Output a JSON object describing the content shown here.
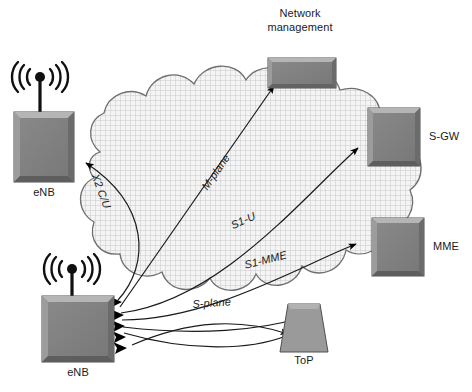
{
  "diagram": {
    "background_color": "#ffffff",
    "cloud": {
      "name": "transport-network-cloud",
      "fill_color": "#f2f2f2",
      "hatch_color": "#c9c9c9",
      "outline_color": "#6e6e6e"
    },
    "nodes": [
      {
        "id": "enb-top",
        "label": "eNB",
        "type": "enb-box",
        "has_antenna": true,
        "fill_color": "#808080"
      },
      {
        "id": "enb-bottom",
        "label": "eNB",
        "type": "enb-box",
        "has_antenna": true,
        "fill_color": "#808080"
      },
      {
        "id": "network-management",
        "label": "Network\nmanagement",
        "label_line1": "Network",
        "label_line2": "management",
        "type": "wide-box",
        "has_antenna": false,
        "fill_color": "#808080"
      },
      {
        "id": "s-gw",
        "label": "S-GW",
        "type": "box",
        "has_antenna": false,
        "fill_color": "#808080"
      },
      {
        "id": "mme",
        "label": "MME",
        "type": "box",
        "has_antenna": false,
        "fill_color": "#808080"
      },
      {
        "id": "top",
        "label": "ToP",
        "type": "trapezoid",
        "has_antenna": false,
        "fill_color": "#9a9a9a"
      }
    ],
    "links": [
      {
        "id": "x2",
        "label": "X2 C/U",
        "from": "enb-bottom",
        "to": "enb-top"
      },
      {
        "id": "m-plane",
        "label": "M-plane",
        "from": "enb-bottom",
        "to": "network-management"
      },
      {
        "id": "s1-u",
        "label": "S1-U",
        "from": "enb-bottom",
        "to": "s-gw"
      },
      {
        "id": "s1-mme",
        "label": "S1-MME",
        "from": "enb-bottom",
        "to": "mme"
      },
      {
        "id": "s-plane",
        "label": "S-plane",
        "from": "top",
        "to": "enb-bottom"
      }
    ]
  }
}
